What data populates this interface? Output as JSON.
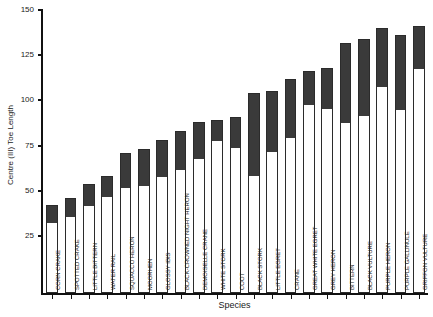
{
  "chart_data": {
    "type": "bar",
    "title": "",
    "xlabel": "Species",
    "ylabel": "Centre (III) Toe Length",
    "ylim": [
      25,
      150
    ],
    "yticks": [
      25,
      50,
      75,
      100,
      125,
      150
    ],
    "grid": false,
    "legend": false,
    "series_note": "Each bar spans a minimum (white lower segment) to a maximum (dark upper segment).",
    "categories": [
      "CORN CRAKE",
      "SPOTTED CRAKE",
      "LITTLE BITTERN",
      "WATER RAIL",
      "SQUACCO HERON",
      "MOORHEN",
      "GLOSSY IBIS",
      "BLACK-CROWNED NIGHT HERON",
      "DEMOISELLE CRANE",
      "WHITE STORK",
      "COOT",
      "BLACK STORK",
      "LITTLE EGRET",
      "CRANE",
      "GREAT WHITE EGRET",
      "GREY HERON",
      "BITTERN",
      "BLACK VULTURE",
      "PURPLE HERON",
      "PURPLE GALLINULE",
      "GRIFFON VULTURE"
    ],
    "series": [
      {
        "name": "Minimum",
        "values": [
          33,
          36,
          42,
          47,
          52,
          53,
          58,
          62,
          68,
          78,
          74,
          59,
          72,
          80,
          98,
          96,
          88,
          92,
          108,
          95,
          118
        ]
      },
      {
        "name": "Maximum",
        "values": [
          42,
          46,
          54,
          58,
          71,
          73,
          78,
          83,
          88,
          89,
          91,
          104,
          105,
          112,
          116,
          118,
          132,
          134,
          140,
          136,
          141
        ]
      }
    ],
    "colors": {
      "min_segment": "#ffffff",
      "max_segment": "#3a3a3a",
      "axis": "#111111",
      "border": "#2b2b2b"
    }
  }
}
